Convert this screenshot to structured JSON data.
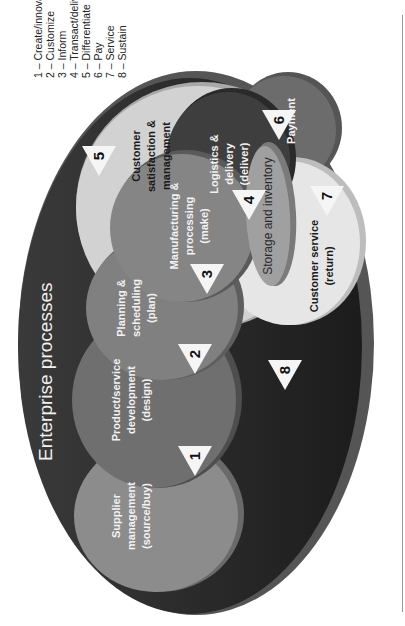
{
  "title": "Enterprise processes",
  "legend": [
    "1 – Create/innovate",
    "2 – Customize",
    "3 – Inform",
    "4 – Transact/deliver",
    "5 – Differentiate",
    "6 – Pay",
    "7 – Service",
    "8 – Sustain"
  ],
  "processes": {
    "supplier": [
      "Supplier",
      "management",
      "(source/buy)"
    ],
    "product": [
      "Product/service",
      "development",
      "(design)"
    ],
    "planning": [
      "Planning &",
      "scheduling",
      "(plan)"
    ],
    "manufacturing": [
      "Manufacturing &",
      "processing",
      "(make)"
    ],
    "customer_satisfaction": [
      "Customer",
      "satisfaction &",
      "management"
    ],
    "logistics": [
      "Logistics &",
      "delivery",
      "(deliver)"
    ],
    "payment": [
      "Payment"
    ],
    "storage": [
      "Storage and inventory"
    ],
    "customer_service": [
      "Customer service",
      "(return)"
    ]
  },
  "markers": [
    "1",
    "2",
    "3",
    "4",
    "5",
    "6",
    "7",
    "8"
  ],
  "colors": {
    "outer": "#262626",
    "supplier": "#8a8a8a",
    "product": "#6e6e6e",
    "planning": "#7f7f7f",
    "manufacturing": "#808080",
    "customer_satisfaction": "#cfcfcf",
    "logistics": "#3f3f3f",
    "payment": "#6a6a6a",
    "storage": "#9c9c9c",
    "customer_service": "#e4e4e4",
    "marker": "#f5f5f5"
  }
}
